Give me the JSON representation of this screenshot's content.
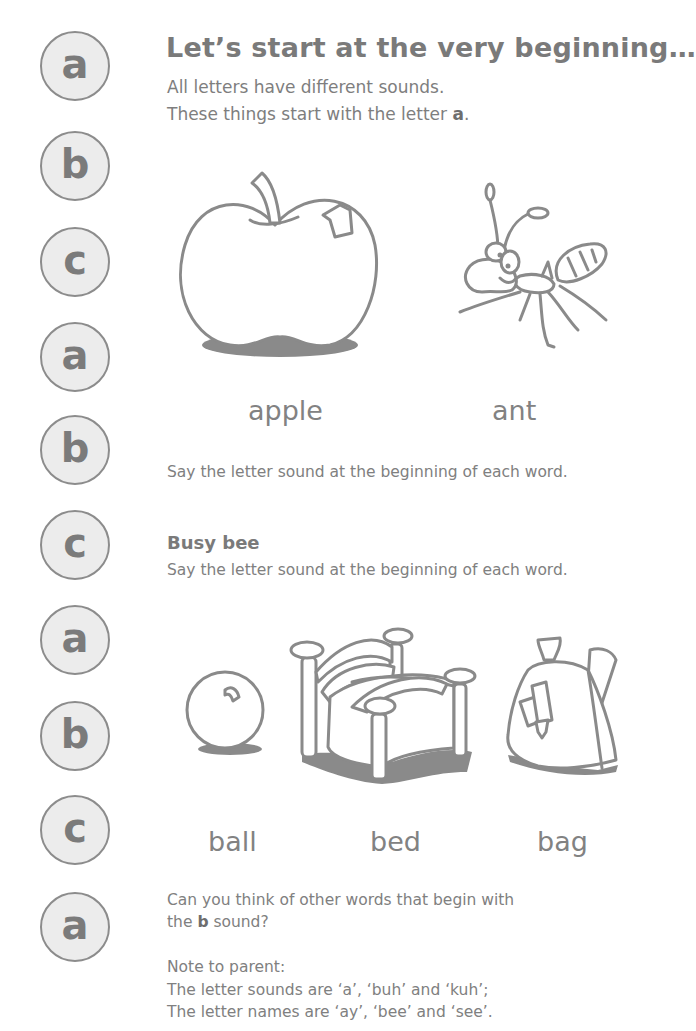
{
  "sidebar": {
    "letters": [
      "a",
      "b",
      "c",
      "a",
      "b",
      "c",
      "a",
      "b",
      "c",
      "a"
    ]
  },
  "section1": {
    "title": "Let’s start at the very beginning…",
    "intro_line1": "All letters have different sounds.",
    "intro_line2_prefix": "These things start with the letter ",
    "intro_line2_bold": "a",
    "intro_line2_suffix": ".",
    "pictures": [
      {
        "icon": "apple-icon",
        "label": "apple"
      },
      {
        "icon": "ant-icon",
        "label": "ant"
      }
    ],
    "instruction": "Say the letter sound at the beginning of each word."
  },
  "section2": {
    "title": "Busy bee",
    "instruction": "Say the letter sound at the beginning of each word.",
    "pictures": [
      {
        "icon": "ball-icon",
        "label": "ball"
      },
      {
        "icon": "bed-icon",
        "label": "bed"
      },
      {
        "icon": "bag-icon",
        "label": "bag"
      }
    ],
    "question_line1": "Can you think of other words that begin with",
    "question_line2_prefix": "the ",
    "question_line2_bold": "b",
    "question_line2_suffix": " sound?"
  },
  "note": {
    "heading": "Note to parent:",
    "line1": "The letter sounds are ‘a’, ‘buh’ and ‘kuh’;",
    "line2": "The letter names are ‘ay’, ‘bee’ and ‘see’."
  }
}
